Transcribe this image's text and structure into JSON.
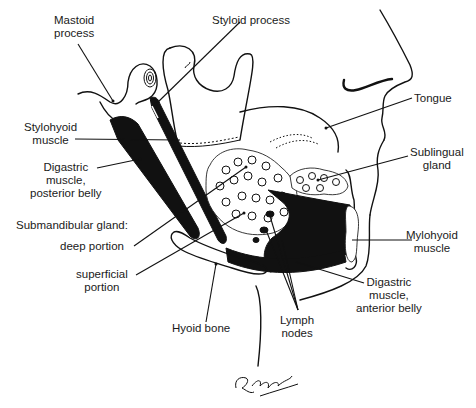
{
  "diagram": {
    "labels": [
      {
        "id": "mastoid-process",
        "text": "Mastoid\nprocess"
      },
      {
        "id": "styloid-process",
        "text": "Styloid process"
      },
      {
        "id": "tongue",
        "text": "Tongue"
      },
      {
        "id": "stylohyoid-muscle",
        "text": "Stylohyoid\nmuscle"
      },
      {
        "id": "sublingual-gland",
        "text": "Sublingual\ngland"
      },
      {
        "id": "digastric-posterior",
        "text": "Digastric\nmuscle,\nposterior belly"
      },
      {
        "id": "submandibular-gland",
        "text": "Submandibular gland:"
      },
      {
        "id": "deep-portion",
        "text": "deep portion"
      },
      {
        "id": "mylohyoid-muscle",
        "text": "Mylohyoid\nmuscle"
      },
      {
        "id": "superficial-portion",
        "text": "superficial\nportion"
      },
      {
        "id": "hyoid-bone",
        "text": "Hyoid bone"
      },
      {
        "id": "lymph-nodes",
        "text": "Lymph\nnodes"
      },
      {
        "id": "digastric-anterior",
        "text": "Digastric\nmuscle,\nanterior belly"
      }
    ],
    "signature": "R. Wellman"
  }
}
